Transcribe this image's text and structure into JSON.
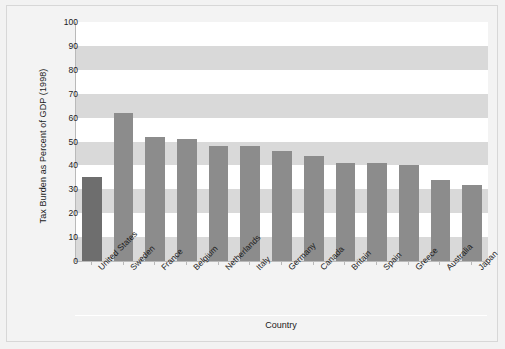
{
  "chart_data": {
    "type": "bar",
    "title": "",
    "xlabel": "Country",
    "ylabel": "Tax Burden as Percent of GDP (1998)",
    "ylim": [
      0,
      100
    ],
    "yticks": [
      0,
      10,
      20,
      30,
      40,
      50,
      60,
      70,
      80,
      90,
      100
    ],
    "grid": "horizontal-bands",
    "legend": "none",
    "categories": [
      "United States",
      "Sweden",
      "France",
      "Belgium",
      "Netherlands",
      "Italy",
      "Germany",
      "Canada",
      "Britain",
      "Spain",
      "Greece",
      "Australia",
      "Japan"
    ],
    "values": [
      35,
      62,
      52,
      51,
      48,
      48,
      46,
      44,
      41,
      41,
      40,
      34,
      32
    ],
    "highlight_index": 0,
    "colors": {
      "bar": "#8c8c8c",
      "bar_highlight": "#6e6e6e",
      "plot_background": "#ffffff",
      "band": "#d9d9d9",
      "figure_background": "#f3f3f3",
      "axis": "#b9b9b9",
      "text": "#1a1a1a"
    }
  }
}
